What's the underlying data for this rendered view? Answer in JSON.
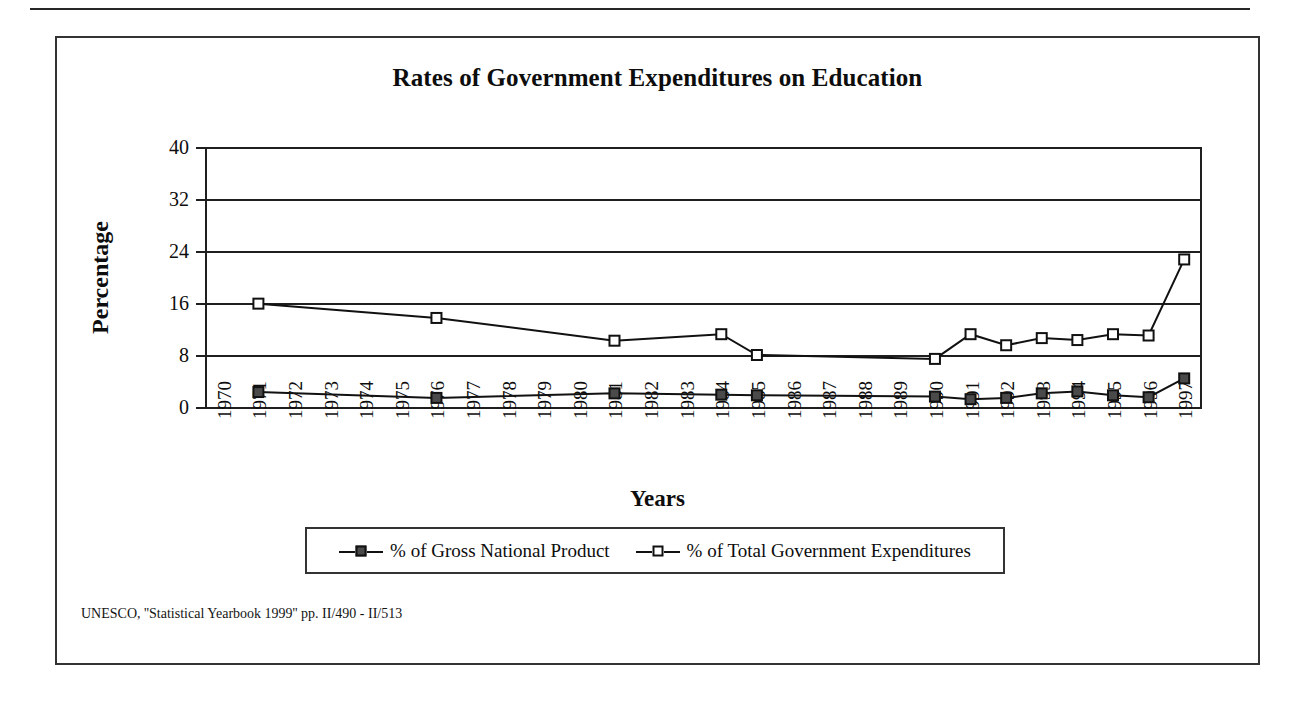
{
  "figure": {
    "title": "Rates of Government Expenditures on Education",
    "x_axis_title": "Years",
    "y_axis_title": "Percentage",
    "source_note": "UNESCO, ''Statistical Yearbook 1999'' pp. II/490 - II/513"
  },
  "legend": {
    "position": "bottom",
    "entries": [
      {
        "label": "% of Gross National Product",
        "marker": "filled-square"
      },
      {
        "label": "% of Total Government Expenditures",
        "marker": "hollow-square"
      }
    ]
  },
  "chart_data": {
    "type": "line",
    "title": "Rates of Government Expenditures on Education",
    "xlabel": "Years",
    "ylabel": "Percentage",
    "ylim": [
      0,
      40
    ],
    "yticks": [
      0,
      8,
      16,
      24,
      32,
      40
    ],
    "grid": true,
    "categories": [
      "1970",
      "1971",
      "1972",
      "1973",
      "1974",
      "1975",
      "1976",
      "1977",
      "1978",
      "1979",
      "1980",
      "1981",
      "1982",
      "1983",
      "1984",
      "1985",
      "1986",
      "1987",
      "1988",
      "1989",
      "1990",
      "1991",
      "1992",
      "1993",
      "1994",
      "1995",
      "1996",
      "1997"
    ],
    "series": [
      {
        "name": "% of Gross National Product",
        "marker": "filled-square",
        "points": [
          {
            "x": "1971",
            "y": 2.3
          },
          {
            "x": "1976",
            "y": 1.4
          },
          {
            "x": "1981",
            "y": 2.1
          },
          {
            "x": "1984",
            "y": 1.9
          },
          {
            "x": "1985",
            "y": 1.8
          },
          {
            "x": "1990",
            "y": 1.6
          },
          {
            "x": "1991",
            "y": 1.2
          },
          {
            "x": "1992",
            "y": 1.4
          },
          {
            "x": "1993",
            "y": 2.1
          },
          {
            "x": "1994",
            "y": 2.4
          },
          {
            "x": "1995",
            "y": 1.8
          },
          {
            "x": "1996",
            "y": 1.5
          },
          {
            "x": "1997",
            "y": 4.4
          }
        ]
      },
      {
        "name": "% of Total Government Expenditures",
        "marker": "hollow-square",
        "points": [
          {
            "x": "1971",
            "y": 15.9
          },
          {
            "x": "1976",
            "y": 13.7
          },
          {
            "x": "1981",
            "y": 10.2
          },
          {
            "x": "1984",
            "y": 11.2
          },
          {
            "x": "1985",
            "y": 8.0
          },
          {
            "x": "1990",
            "y": 7.4
          },
          {
            "x": "1991",
            "y": 11.2
          },
          {
            "x": "1992",
            "y": 9.5
          },
          {
            "x": "1993",
            "y": 10.6
          },
          {
            "x": "1994",
            "y": 10.3
          },
          {
            "x": "1995",
            "y": 11.2
          },
          {
            "x": "1996",
            "y": 11.0
          },
          {
            "x": "1997",
            "y": 22.7
          }
        ]
      }
    ]
  },
  "colors": {
    "line": "#111111",
    "filled_marker": "#4a4a4a",
    "frame": "#333333",
    "text": "#0d0d0d"
  }
}
